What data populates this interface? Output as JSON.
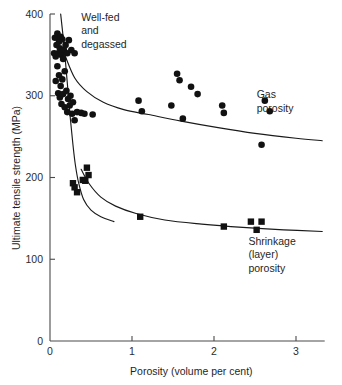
{
  "chart_data": {
    "type": "scatter",
    "title": "",
    "xlabel": "Porosity (volume per cent)",
    "ylabel": "Ultimate tensile strength (MPa)",
    "xlim": [
      0,
      3.35
    ],
    "ylim": [
      0,
      400
    ],
    "xticks": [
      0,
      1,
      2,
      3
    ],
    "xtick_labels": [
      "0",
      "1",
      "2",
      "3"
    ],
    "yticks": [
      0,
      100,
      200,
      300,
      400
    ],
    "ytick_labels": [
      "0",
      "100",
      "200",
      "300",
      "400"
    ],
    "grid": false,
    "legend_position": "inline-annotations",
    "annotations": [
      {
        "id": "well-fed",
        "lines": [
          "Well-fed",
          "and",
          "degassed"
        ],
        "x": 0.38,
        "y": 392
      },
      {
        "id": "gas-porosity",
        "lines": [
          "Gas",
          "porosity"
        ],
        "x": 2.52,
        "y": 297
      },
      {
        "id": "shrinkage-porosity",
        "lines": [
          "Shrinkage",
          "(layer)",
          "porosity"
        ],
        "x": 2.42,
        "y": 118
      }
    ],
    "series": [
      {
        "name": "Gas porosity",
        "marker": "circle",
        "color": "#111111",
        "points": [
          [
            0.06,
            371
          ],
          [
            0.09,
            376
          ],
          [
            0.11,
            366
          ],
          [
            0.13,
            372
          ],
          [
            0.08,
            362
          ],
          [
            0.12,
            358
          ],
          [
            0.15,
            369
          ],
          [
            0.1,
            352
          ],
          [
            0.14,
            350
          ],
          [
            0.17,
            356
          ],
          [
            0.19,
            362
          ],
          [
            0.21,
            352
          ],
          [
            0.16,
            345
          ],
          [
            0.07,
            348
          ],
          [
            0.05,
            352
          ],
          [
            0.23,
            368
          ],
          [
            0.26,
            356
          ],
          [
            0.3,
            352
          ],
          [
            0.09,
            336
          ],
          [
            0.11,
            325
          ],
          [
            0.07,
            318
          ],
          [
            0.13,
            312
          ],
          [
            0.15,
            320
          ],
          [
            0.18,
            330
          ],
          [
            0.1,
            303
          ],
          [
            0.12,
            298
          ],
          [
            0.16,
            302
          ],
          [
            0.2,
            306
          ],
          [
            0.22,
            296
          ],
          [
            0.25,
            300
          ],
          [
            0.14,
            290
          ],
          [
            0.18,
            286
          ],
          [
            0.24,
            288
          ],
          [
            0.28,
            292
          ],
          [
            0.21,
            280
          ],
          [
            0.27,
            278
          ],
          [
            0.33,
            280
          ],
          [
            0.38,
            279
          ],
          [
            0.3,
            270
          ],
          [
            0.42,
            278
          ],
          [
            0.52,
            277
          ],
          [
            1.08,
            294
          ],
          [
            1.12,
            281
          ],
          [
            1.55,
            327
          ],
          [
            1.58,
            319
          ],
          [
            1.72,
            311
          ],
          [
            1.8,
            302
          ],
          [
            1.48,
            288
          ],
          [
            1.62,
            272
          ],
          [
            2.1,
            288
          ],
          [
            2.12,
            279
          ],
          [
            2.62,
            294
          ],
          [
            2.68,
            281
          ],
          [
            2.58,
            240
          ]
        ]
      },
      {
        "name": "Shrinkage (layer) porosity",
        "marker": "square",
        "color": "#111111",
        "points": [
          [
            0.28,
            193
          ],
          [
            0.3,
            188
          ],
          [
            0.4,
            197
          ],
          [
            0.43,
            196
          ],
          [
            0.45,
            212
          ],
          [
            0.47,
            203
          ],
          [
            0.33,
            182
          ],
          [
            1.1,
            152
          ],
          [
            2.12,
            140
          ],
          [
            2.45,
            146
          ],
          [
            2.58,
            146
          ],
          [
            2.52,
            136
          ]
        ]
      }
    ],
    "curves": [
      {
        "id": "well-fed-boundary",
        "description": "steep descending boundary curve for well-fed and degassed castings",
        "points": [
          [
            0.13,
            400
          ],
          [
            0.16,
            372
          ],
          [
            0.19,
            340
          ],
          [
            0.22,
            305
          ],
          [
            0.25,
            270
          ],
          [
            0.28,
            240
          ],
          [
            0.31,
            215
          ],
          [
            0.35,
            193
          ],
          [
            0.41,
            173
          ],
          [
            0.5,
            160
          ],
          [
            0.62,
            152
          ],
          [
            0.78,
            146
          ]
        ]
      },
      {
        "id": "gas-porosity-trend",
        "description": "upper trend curve through gas porosity data",
        "points": [
          [
            0.18,
            350
          ],
          [
            0.3,
            322
          ],
          [
            0.45,
            305
          ],
          [
            0.65,
            292
          ],
          [
            0.9,
            283
          ],
          [
            1.2,
            277
          ],
          [
            1.6,
            269
          ],
          [
            2.05,
            261
          ],
          [
            2.5,
            254
          ],
          [
            3.0,
            248
          ],
          [
            3.32,
            245
          ]
        ]
      },
      {
        "id": "shrinkage-porosity-trend",
        "description": "lower trend curve through shrinkage porosity data",
        "points": [
          [
            0.38,
            210
          ],
          [
            0.48,
            192
          ],
          [
            0.62,
            176
          ],
          [
            0.8,
            165
          ],
          [
            1.05,
            156
          ],
          [
            1.4,
            148
          ],
          [
            1.85,
            143
          ],
          [
            2.35,
            139
          ],
          [
            2.85,
            136
          ],
          [
            3.32,
            134
          ]
        ]
      }
    ]
  }
}
